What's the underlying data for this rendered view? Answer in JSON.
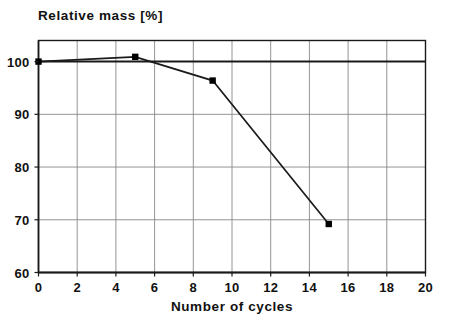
{
  "chart_data": {
    "type": "line",
    "title": "",
    "xlabel": "Number of cycles",
    "ylabel": "Relative mass [%]",
    "x": [
      0,
      5,
      9,
      15
    ],
    "values": [
      100.0,
      100.9,
      96.4,
      69.2
    ],
    "series": [
      {
        "name": "Relative mass",
        "x": [
          0,
          5,
          9,
          15
        ],
        "values": [
          100.0,
          100.9,
          96.4,
          69.2
        ]
      }
    ],
    "xlim": [
      0,
      20
    ],
    "ylim": [
      60,
      104
    ],
    "xticks": [
      0,
      2,
      4,
      6,
      8,
      10,
      12,
      14,
      16,
      18,
      20
    ],
    "yticks": [
      60,
      70,
      80,
      90,
      100
    ],
    "xtick_labels": [
      "0",
      "2",
      "4",
      "6",
      "8",
      "10",
      "12",
      "14",
      "16",
      "18",
      "20"
    ],
    "ytick_labels": [
      "60",
      "70",
      "80",
      "90",
      "100"
    ],
    "grid": true,
    "legend": "none",
    "marker": "square",
    "reference_lines": [
      {
        "axis": "y",
        "value": 100,
        "label": "",
        "emphasis": "bold"
      }
    ],
    "colors": {
      "line": "#1a1a1a",
      "marker": "#000000",
      "grid": "#888888",
      "axis": "#1a1a1a",
      "background": "#ffffff",
      "text": "#111111"
    }
  },
  "axes": {
    "y_title": "Relative mass [%]",
    "x_title": "Number of cycles"
  }
}
